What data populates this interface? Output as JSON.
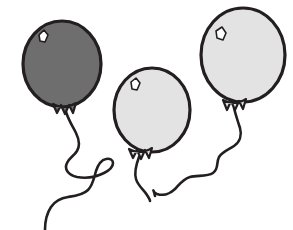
{
  "scene": {
    "title": "Three Balloons",
    "description": "Line-art illustration of three balloons with long curling strings",
    "width": 293,
    "height": 230,
    "background_color": "#ffffff",
    "outline_color": "#231f20",
    "string_color": "#231f20"
  },
  "balloons": [
    {
      "id": "balloon-dark-left",
      "label": "Dark gray balloon",
      "fill_color": "#6e6e6e",
      "outline_color": "#231f20",
      "outline_width": 3.2,
      "center_x": 62,
      "center_y": 64,
      "radius_x": 39,
      "radius_y": 43,
      "highlight": {
        "label": "balloon-highlight",
        "fill_color": "#ffffff",
        "x": 41,
        "y": 33
      },
      "knot": {
        "label": "balloon-knot",
        "x": 65,
        "y": 107
      },
      "string": {
        "label": "balloon-string",
        "stroke_width": 2.6,
        "start_x": 66,
        "start_y": 112,
        "end_x": 45,
        "end_y": 230
      }
    },
    {
      "id": "balloon-light-middle",
      "label": "Light gray balloon",
      "fill_color": "#e3e3e3",
      "outline_color": "#231f20",
      "outline_width": 3.2,
      "center_x": 152,
      "center_y": 110,
      "radius_x": 38,
      "radius_y": 42,
      "highlight": {
        "label": "balloon-highlight",
        "fill_color": "#ffffff",
        "x": 133,
        "y": 81
      },
      "knot": {
        "label": "balloon-knot",
        "x": 140,
        "y": 152
      },
      "string": {
        "label": "balloon-string",
        "stroke_width": 2.6,
        "start_x": 139,
        "start_y": 157,
        "end_x": 150,
        "end_y": 201
      }
    },
    {
      "id": "balloon-light-right",
      "label": "Light gray balloon",
      "fill_color": "#e3e3e3",
      "outline_color": "#231f20",
      "outline_width": 3.2,
      "center_x": 243,
      "center_y": 55,
      "radius_x": 42,
      "radius_y": 47,
      "highlight": {
        "label": "balloon-highlight",
        "fill_color": "#ffffff",
        "x": 219,
        "y": 30
      },
      "knot": {
        "label": "balloon-knot",
        "x": 235,
        "y": 103
      },
      "string": {
        "label": "balloon-string",
        "stroke_width": 2.6,
        "start_x": 234,
        "start_y": 108,
        "end_x": 155,
        "end_y": 196
      }
    }
  ]
}
